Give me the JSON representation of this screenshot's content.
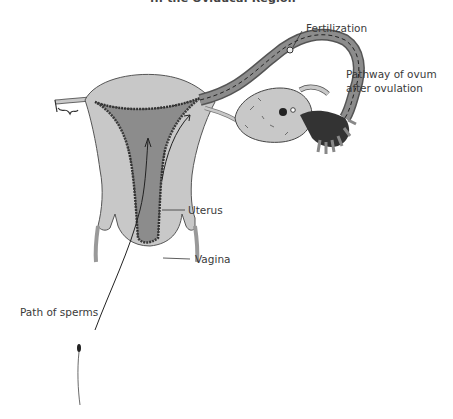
{
  "figure": {
    "caption_partial": "... the Oviducal Region",
    "colors": {
      "uterus_fill": "#c8c8c8",
      "cavity_fill": "#8c8c8c",
      "outline": "#555555",
      "lining": "#3a3a3a",
      "label_text": "#3a3a3a",
      "background": "#ffffff"
    },
    "labels": {
      "fertilization": "Fertilization",
      "ovum_pathway_line1": "Pathway of ovum",
      "ovum_pathway_line2": "after ovulation",
      "uterus": "Uterus",
      "vagina": "Vagina",
      "sperm_path": "Path of sperms"
    }
  }
}
